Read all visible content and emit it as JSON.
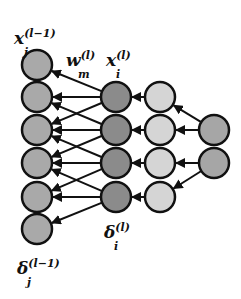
{
  "diagram": {
    "colors": {
      "prev_layer": "#a9a9a9",
      "current_layer": "#8b8b8b",
      "next_layer": "#d5d5d5",
      "last_layer": "#a6a6a6",
      "stroke": "#111111",
      "edge": "#111111"
    },
    "layers": [
      {
        "name": "prev-layer",
        "x": 37,
        "radius": 15,
        "nodes_y": [
          65,
          97,
          130,
          163,
          197,
          229
        ]
      },
      {
        "name": "current-layer",
        "x": 116,
        "radius": 15,
        "nodes_y": [
          97,
          130,
          163,
          197
        ]
      },
      {
        "name": "next-layer",
        "x": 160,
        "radius": 15,
        "nodes_y": [
          97,
          130,
          163,
          197
        ]
      },
      {
        "name": "last-layer",
        "x": 214,
        "radius": 15,
        "nodes_y": [
          130,
          163
        ]
      }
    ],
    "edges_current_to_prev": [
      [
        0,
        0
      ],
      [
        0,
        1
      ],
      [
        0,
        2
      ],
      [
        1,
        1
      ],
      [
        1,
        2
      ],
      [
        1,
        3
      ],
      [
        2,
        2
      ],
      [
        2,
        3
      ],
      [
        2,
        4
      ],
      [
        3,
        3
      ],
      [
        3,
        4
      ],
      [
        3,
        5
      ]
    ],
    "edges_next_to_current": [
      [
        0,
        0
      ],
      [
        1,
        1
      ],
      [
        2,
        2
      ],
      [
        3,
        3
      ]
    ],
    "edges_last_to_next": [
      [
        0,
        0
      ],
      [
        0,
        1
      ],
      [
        1,
        2
      ],
      [
        1,
        3
      ]
    ],
    "labels": {
      "x_prev": {
        "base": "x",
        "sub": "j",
        "sup": "(l−1)"
      },
      "w": {
        "base": "w",
        "sub": "m",
        "sup": "(l)"
      },
      "x_cur": {
        "base": "x",
        "sub": "i",
        "sup": "(l)"
      },
      "delta_cur": {
        "base": "δ",
        "sub": "i",
        "sup": "(l)"
      },
      "delta_prev": {
        "base": "δ",
        "sub": "j",
        "sup": "(l−1)"
      }
    }
  }
}
